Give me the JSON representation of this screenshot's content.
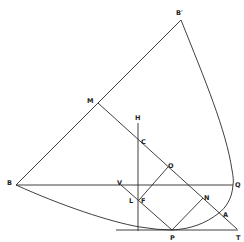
{
  "diagram": {
    "type": "geometric-construction",
    "stroke_color": "#2a2a2a",
    "background": "#ffffff",
    "points": {
      "B_prime": {
        "label": "B′",
        "x": 181,
        "y": 20
      },
      "M": {
        "label": "M",
        "x": 98,
        "y": 103
      },
      "H": {
        "label": "H",
        "x": 138,
        "y": 123
      },
      "C": {
        "label": "C",
        "x": 138,
        "y": 139
      },
      "O": {
        "label": "O",
        "x": 168,
        "y": 167
      },
      "B": {
        "label": "B",
        "x": 16,
        "y": 185
      },
      "V": {
        "label": "V",
        "x": 121,
        "y": 185
      },
      "Q": {
        "label": "Q",
        "x": 233,
        "y": 185
      },
      "L": {
        "label": "L",
        "x": 138,
        "y": 201
      },
      "F": {
        "label": "F",
        "x": 139,
        "y": 201
      },
      "N": {
        "label": "N",
        "x": 203,
        "y": 198
      },
      "A": {
        "label": "A",
        "x": 219,
        "y": 213
      },
      "P": {
        "label": "P",
        "x": 172,
        "y": 230
      },
      "T": {
        "label": "T",
        "x": 237,
        "y": 230
      }
    },
    "labels": [
      {
        "text": "B′",
        "x": 176,
        "y": 15
      },
      {
        "text": "M",
        "x": 87,
        "y": 103
      },
      {
        "text": "H",
        "x": 135,
        "y": 120
      },
      {
        "text": "C",
        "x": 141,
        "y": 144
      },
      {
        "text": "O",
        "x": 168,
        "y": 168
      },
      {
        "text": "B",
        "x": 7,
        "y": 185
      },
      {
        "text": "V",
        "x": 117,
        "y": 185
      },
      {
        "text": "Q",
        "x": 235,
        "y": 187
      },
      {
        "text": "L",
        "x": 129,
        "y": 203
      },
      {
        "text": "F",
        "x": 141,
        "y": 203
      },
      {
        "text": "N",
        "x": 204,
        "y": 200
      },
      {
        "text": "A",
        "x": 223,
        "y": 217
      },
      {
        "text": "P",
        "x": 170,
        "y": 240
      },
      {
        "text": "T",
        "x": 236,
        "y": 240
      }
    ],
    "segments": [
      {
        "name": "B-B_prime",
        "from": "B",
        "to": "B_prime"
      },
      {
        "name": "B-Q",
        "from": "B",
        "to": "Q"
      },
      {
        "name": "M-T",
        "from": "M",
        "to": "T"
      },
      {
        "name": "H-vertical",
        "from": "H",
        "to": "foot"
      },
      {
        "name": "V-P",
        "from": "V",
        "to": "P"
      },
      {
        "name": "F-O",
        "from": "F",
        "to": "O"
      },
      {
        "name": "P-N",
        "from": "P",
        "to": "N"
      },
      {
        "name": "tangent-T",
        "from": "tangent_start",
        "to": "T"
      }
    ],
    "curves": [
      {
        "name": "curve-B_prime-Q",
        "description": "arc from B′ down to Q"
      },
      {
        "name": "curve-Q-A-P",
        "description": "arc from Q through A to P"
      },
      {
        "name": "curve-B-P",
        "description": "arc from B down to P, tangent to base line"
      }
    ]
  }
}
